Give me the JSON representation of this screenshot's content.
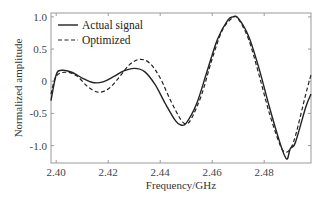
{
  "chart_data": {
    "type": "line",
    "title": "",
    "xlabel": "Frequency/GHz",
    "ylabel": "Normalized amplitude",
    "xlim": [
      2.398,
      2.498
    ],
    "ylim": [
      -1.27,
      1.06
    ],
    "grid": false,
    "legend_position": "upper left",
    "x_ticks": [
      2.4,
      2.42,
      2.44,
      2.46,
      2.48
    ],
    "x_tick_labels": [
      "2.40",
      "2.42",
      "2.44",
      "2.46",
      "2.48"
    ],
    "y_ticks": [
      1.0,
      0.5,
      0,
      -0.5,
      -1.0
    ],
    "y_tick_labels": [
      "1.0",
      "0.5",
      "0",
      "-0.5",
      "-1.0"
    ],
    "series": [
      {
        "name": "Actual signal",
        "style": "solid",
        "color": "#222222",
        "x": [
          2.398,
          2.4,
          2.402,
          2.406,
          2.41,
          2.414,
          2.418,
          2.422,
          2.426,
          2.43,
          2.434,
          2.438,
          2.442,
          2.446,
          2.448,
          2.45,
          2.454,
          2.458,
          2.462,
          2.466,
          2.468,
          2.47,
          2.474,
          2.478,
          2.482,
          2.486,
          2.488,
          2.489,
          2.49,
          2.492,
          2.496,
          2.498
        ],
        "values": [
          -0.3,
          0.1,
          0.17,
          0.14,
          0.05,
          -0.02,
          -0.01,
          0.07,
          0.16,
          0.2,
          0.15,
          -0.05,
          -0.35,
          -0.62,
          -0.68,
          -0.65,
          -0.35,
          0.15,
          0.65,
          0.95,
          1.0,
          0.98,
          0.7,
          0.2,
          -0.4,
          -0.95,
          -1.17,
          -1.2,
          -1.05,
          -0.95,
          -0.4,
          -0.2
        ]
      },
      {
        "name": "Optimized",
        "style": "dashed",
        "color": "#222222",
        "x": [
          2.398,
          2.4,
          2.404,
          2.408,
          2.412,
          2.416,
          2.42,
          2.424,
          2.428,
          2.432,
          2.436,
          2.44,
          2.444,
          2.448,
          2.45,
          2.452,
          2.456,
          2.46,
          2.464,
          2.468,
          2.47,
          2.474,
          2.478,
          2.482,
          2.486,
          2.488,
          2.49,
          2.492,
          2.496,
          2.498
        ],
        "values": [
          -0.2,
          0.08,
          0.14,
          0.08,
          -0.08,
          -0.17,
          -0.12,
          0.05,
          0.25,
          0.34,
          0.28,
          0.05,
          -0.3,
          -0.6,
          -0.66,
          -0.58,
          -0.2,
          0.35,
          0.8,
          0.99,
          0.97,
          0.65,
          0.1,
          -0.5,
          -0.98,
          -1.1,
          -1.05,
          -0.85,
          -0.2,
          0.1
        ]
      }
    ]
  },
  "legend": {
    "items": [
      {
        "label": "Actual signal",
        "style": "solid"
      },
      {
        "label": "Optimized",
        "style": "dashed"
      }
    ]
  },
  "axes": {
    "xlabel": "Frequency/GHz",
    "ylabel": "Normalized amplitude"
  },
  "colors": {
    "axis": "#888888",
    "line": "#222222",
    "background": "#ffffff"
  }
}
